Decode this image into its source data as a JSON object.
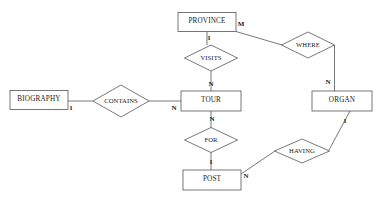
{
  "diagram": {
    "type": "er-diagram",
    "background_color": "#ffffff",
    "line_color": "#555555",
    "text_color": "#1a1a1a",
    "entities": [
      {
        "id": "province",
        "label": "PROVINCE",
        "x": 207,
        "y": 22,
        "w": 58,
        "h": 19
      },
      {
        "id": "biography",
        "label": "BIOGRAPHY",
        "x": 39,
        "y": 100,
        "w": 58,
        "h": 19
      },
      {
        "id": "tour",
        "label": "TOUR",
        "x": 211,
        "y": 101,
        "w": 60,
        "h": 20
      },
      {
        "id": "organ",
        "label": "ORGAN",
        "x": 342,
        "y": 101,
        "w": 60,
        "h": 20
      },
      {
        "id": "post",
        "label": "POST",
        "x": 212,
        "y": 180,
        "w": 58,
        "h": 20
      }
    ],
    "relationships": [
      {
        "id": "visits",
        "label": "VISITS",
        "x": 211,
        "y": 58,
        "w": 53,
        "h": 26
      },
      {
        "id": "where",
        "label": "WHERE",
        "x": 308,
        "y": 45,
        "w": 53,
        "h": 26
      },
      {
        "id": "contains",
        "label": "CONTAINS",
        "x": 121,
        "y": 101,
        "w": 56,
        "h": 32
      },
      {
        "id": "for",
        "label": "FOR",
        "x": 211,
        "y": 140,
        "w": 53,
        "h": 25
      },
      {
        "id": "having",
        "label": "HAVING",
        "x": 302,
        "y": 151,
        "w": 55,
        "h": 24
      }
    ],
    "cardinalities": [
      {
        "id": "province-visits",
        "label": "1",
        "x": 209,
        "y": 38
      },
      {
        "id": "province-where",
        "label": "M",
        "x": 241,
        "y": 24
      },
      {
        "id": "where-organ",
        "label": "N",
        "x": 328,
        "y": 82
      },
      {
        "id": "visits-tour",
        "label": "N",
        "x": 211,
        "y": 84
      },
      {
        "id": "biography-contains",
        "label": "1",
        "x": 71,
        "y": 108
      },
      {
        "id": "contains-tour",
        "label": "N",
        "x": 174,
        "y": 108
      },
      {
        "id": "tour-for",
        "label": "N",
        "x": 212,
        "y": 119
      },
      {
        "id": "for-post",
        "label": "1",
        "x": 211,
        "y": 162
      },
      {
        "id": "post-having",
        "label": "N",
        "x": 246,
        "y": 176
      },
      {
        "id": "organ-having",
        "label": "1",
        "x": 345,
        "y": 121
      }
    ],
    "connections": [
      {
        "id": "province-to-visits",
        "from": "province",
        "to": "visits",
        "points": "207,31.5 207,45"
      },
      {
        "id": "visits-to-tour",
        "from": "visits",
        "to": "tour",
        "points": "211,71 211,91"
      },
      {
        "id": "province-to-where",
        "from": "province",
        "to": "where",
        "points": "236,31.5 282,45"
      },
      {
        "id": "where-to-organ",
        "from": "where",
        "to": "organ",
        "points": "334.5,45 334.5,91"
      },
      {
        "id": "biography-to-contains",
        "from": "biography",
        "to": "contains",
        "points": "68,101 93,101"
      },
      {
        "id": "contains-to-tour",
        "from": "contains",
        "to": "tour",
        "points": "149,101 181,101"
      },
      {
        "id": "tour-to-for",
        "from": "tour",
        "to": "for",
        "points": "211,111 211,128"
      },
      {
        "id": "for-to-post",
        "from": "for",
        "to": "post",
        "points": "211,152 211,170"
      },
      {
        "id": "post-to-having",
        "from": "post",
        "to": "having",
        "points": "241,174 275,151"
      },
      {
        "id": "having-to-organ",
        "from": "having",
        "to": "organ",
        "points": "329,150 350,111"
      }
    ]
  }
}
